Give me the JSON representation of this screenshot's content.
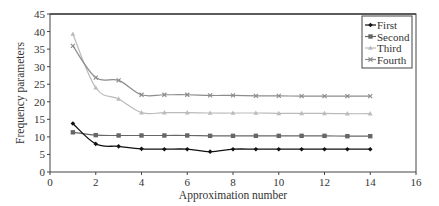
{
  "chart_data": {
    "type": "line",
    "title": "",
    "xlabel": "Approximation number",
    "ylabel": "Frequency parameters",
    "xlim": [
      0,
      16
    ],
    "ylim": [
      0,
      45
    ],
    "xticks": [
      0,
      2,
      4,
      6,
      8,
      10,
      12,
      14,
      16
    ],
    "yticks": [
      0,
      5,
      10,
      15,
      20,
      25,
      30,
      35,
      40,
      45
    ],
    "grid": false,
    "legend_position": "upper right",
    "x": [
      1,
      2,
      3,
      4,
      5,
      6,
      7,
      8,
      9,
      10,
      11,
      12,
      13,
      14
    ],
    "series": [
      {
        "name": "First",
        "color": "#111111",
        "marker": "diamond",
        "values": [
          13.8,
          8.0,
          7.3,
          6.6,
          6.5,
          6.5,
          5.8,
          6.5,
          6.5,
          6.5,
          6.5,
          6.5,
          6.5,
          6.5
        ]
      },
      {
        "name": "Second",
        "color": "#666666",
        "marker": "square",
        "values": [
          11.3,
          10.5,
          10.4,
          10.4,
          10.4,
          10.4,
          10.3,
          10.3,
          10.3,
          10.3,
          10.3,
          10.3,
          10.2,
          10.2
        ]
      },
      {
        "name": "Third",
        "color": "#bbbbbb",
        "marker": "triangle",
        "values": [
          39.3,
          24.0,
          20.8,
          16.9,
          16.9,
          16.9,
          16.8,
          16.8,
          16.8,
          16.7,
          16.7,
          16.7,
          16.6,
          16.6
        ]
      },
      {
        "name": "Fourth",
        "color": "#8c8c8c",
        "marker": "x",
        "values": [
          35.9,
          26.9,
          26.1,
          22.0,
          22.0,
          22.0,
          21.8,
          21.8,
          21.7,
          21.7,
          21.6,
          21.6,
          21.6,
          21.6
        ]
      }
    ]
  }
}
